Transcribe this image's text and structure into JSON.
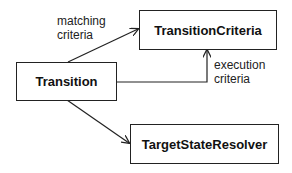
{
  "diagram": {
    "nodes": [
      {
        "id": "transition",
        "label": "Transition"
      },
      {
        "id": "transition_criteria",
        "label": "TransitionCriteria"
      },
      {
        "id": "target_state_resolver",
        "label": "TargetStateResolver"
      }
    ],
    "edges": [
      {
        "from": "transition",
        "to": "transition_criteria",
        "label_line1": "matching",
        "label_line2": "criteria"
      },
      {
        "from": "transition",
        "to": "transition_criteria",
        "label_line1": "execution",
        "label_line2": "criteria"
      },
      {
        "from": "transition",
        "to": "target_state_resolver",
        "label_line1": "",
        "label_line2": ""
      }
    ]
  }
}
